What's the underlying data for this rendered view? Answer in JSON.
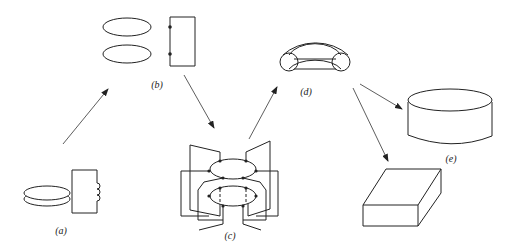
{
  "diagram": {
    "labels": {
      "a": "(a)",
      "b": "(b)",
      "c": "(c)",
      "d": "(d)",
      "e": "(e)"
    },
    "nodes": [
      {
        "id": "a",
        "label": "(a)",
        "shape": "stacked discs with inductor coil"
      },
      {
        "id": "b",
        "label": "(b)",
        "shape": "two loops connected to rectangle"
      },
      {
        "id": "c",
        "label": "(c)",
        "shape": "interleaved double loop winding"
      },
      {
        "id": "d",
        "label": "(d)",
        "shape": "half toroid"
      },
      {
        "id": "e",
        "label": "(e)",
        "shape": "cylinder"
      },
      {
        "id": "f",
        "label": "",
        "shape": "rectangular block"
      }
    ],
    "edges": [
      {
        "from": "a",
        "to": "b"
      },
      {
        "from": "b",
        "to": "c"
      },
      {
        "from": "c",
        "to": "d"
      },
      {
        "from": "d",
        "to": "e"
      },
      {
        "from": "d",
        "to": "f"
      }
    ],
    "colors": {
      "stroke": "#222222",
      "background": "#ffffff"
    }
  }
}
